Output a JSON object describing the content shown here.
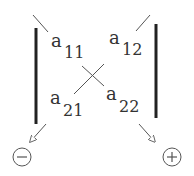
{
  "diagram": {
    "elements": [
      {
        "base": "a",
        "sub": "11"
      },
      {
        "base": "a",
        "sub": "12"
      },
      {
        "base": "a",
        "sub": "21"
      },
      {
        "base": "a",
        "sub": "22"
      }
    ],
    "signs": {
      "minus": "−",
      "plus": "+"
    },
    "colors": {
      "line": "#222222",
      "text": "#333333"
    }
  }
}
